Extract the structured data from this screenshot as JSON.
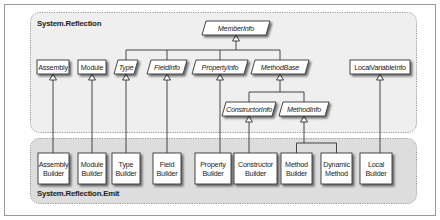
{
  "groups": {
    "reflection": {
      "label": "System.Reflection",
      "fill": "#eeeeee"
    },
    "emit": {
      "label": "System.Reflection.Emit",
      "fill": "#dcdcdc"
    }
  },
  "nodes": {
    "member_info": {
      "label": "MemberInfo",
      "abstract": true
    },
    "assembly": {
      "label": "Assembly",
      "abstract": false
    },
    "module": {
      "label": "Module",
      "abstract": false
    },
    "type": {
      "label": "Type",
      "abstract": true
    },
    "field_info": {
      "label": "FieldInfo",
      "abstract": true
    },
    "property_info": {
      "label": "PropertyInfo",
      "abstract": true
    },
    "method_base": {
      "label": "MethodBase",
      "abstract": true
    },
    "local_variable_info": {
      "label": "LocalVariableInfo",
      "abstract": false
    },
    "constructor_info": {
      "label": "ConstructorInfo",
      "abstract": true
    },
    "method_info": {
      "label": "MethodInfo",
      "abstract": true
    },
    "assembly_builder": {
      "line1": "Assembly",
      "line2": "Builder"
    },
    "module_builder": {
      "line1": "Module",
      "line2": "Builder"
    },
    "type_builder": {
      "line1": "Type",
      "line2": "Builder"
    },
    "field_builder": {
      "line1": "Field",
      "line2": "Builder"
    },
    "property_builder": {
      "line1": "Property",
      "line2": "Builder"
    },
    "constructor_builder": {
      "line1": "Constructor",
      "line2": "Builder"
    },
    "method_builder": {
      "line1": "Method",
      "line2": "Builder"
    },
    "dynamic_method": {
      "line1": "Dynamic",
      "line2": "Method"
    },
    "local_builder": {
      "line1": "Local",
      "line2": "Builder"
    }
  },
  "edges": [
    {
      "from": "type",
      "to": "member_info"
    },
    {
      "from": "field_info",
      "to": "member_info"
    },
    {
      "from": "property_info",
      "to": "member_info"
    },
    {
      "from": "method_base",
      "to": "member_info"
    },
    {
      "from": "constructor_info",
      "to": "method_base"
    },
    {
      "from": "method_info",
      "to": "method_base"
    },
    {
      "from": "assembly_builder",
      "to": "assembly"
    },
    {
      "from": "module_builder",
      "to": "module"
    },
    {
      "from": "type_builder",
      "to": "type"
    },
    {
      "from": "field_builder",
      "to": "field_info"
    },
    {
      "from": "property_builder",
      "to": "property_info"
    },
    {
      "from": "constructor_builder",
      "to": "constructor_info"
    },
    {
      "from": "method_builder",
      "to": "method_info"
    },
    {
      "from": "dynamic_method",
      "to": "method_info"
    },
    {
      "from": "local_builder",
      "to": "local_variable_info"
    }
  ]
}
